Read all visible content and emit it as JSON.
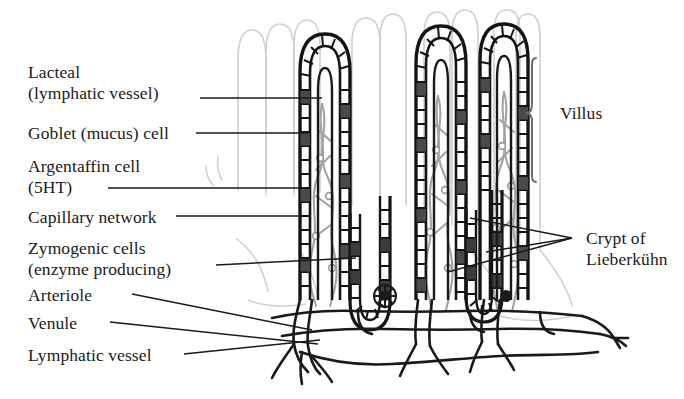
{
  "figure": {
    "colors": {
      "ink": "#1a1a1a",
      "epithelium": "#141414",
      "goblet_fill": "#4a4a4a",
      "zymogenic_fill": "#3c3c3c",
      "capillary": "#a9a9a9",
      "ghost_villi": "#cfcfcf",
      "background": "#ffffff",
      "brace": "#6b6b6b"
    }
  },
  "labels_left": [
    {
      "id": "lacteal",
      "line1": "Lacteal",
      "line2": "(lymphatic vessel)"
    },
    {
      "id": "goblet",
      "line1": "Goblet (mucus) cell",
      "line2": ""
    },
    {
      "id": "argentaffin",
      "line1": "Argentaffin cell",
      "line2": "(5HT)"
    },
    {
      "id": "capillary",
      "line1": "Capillary network",
      "line2": ""
    },
    {
      "id": "zymogenic",
      "line1": "Zymogenic cells",
      "line2": "(enzyme producing)"
    },
    {
      "id": "arteriole",
      "line1": "Arteriole",
      "line2": ""
    },
    {
      "id": "venule",
      "line1": "Venule",
      "line2": ""
    },
    {
      "id": "lymphatic",
      "line1": "Lymphatic vessel",
      "line2": ""
    }
  ],
  "labels_right": [
    {
      "id": "villus",
      "line1": "Villus",
      "line2": ""
    },
    {
      "id": "crypt",
      "line1": "Crypt of",
      "line2": "Lieberkühn"
    }
  ],
  "structures": {
    "villus_count": 3,
    "ghost_villus_count": 9,
    "crypt_count": 2,
    "epithelium_note": "ladder of columnar epithelial cells",
    "dark_cells_note": "dark filled cells are goblet and zymogenic cells"
  }
}
